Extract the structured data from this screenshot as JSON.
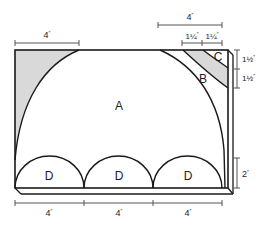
{
  "diagram": {
    "type": "geometry-area-figure",
    "colors": {
      "stroke": "#1a1a1a",
      "shaded": "#d9d9d9",
      "background": "#ffffff",
      "dimension_line": "#555555"
    },
    "regions": {
      "A": "A",
      "B": "B",
      "C": "C",
      "D1": "D",
      "D2": "D",
      "D3": "D"
    },
    "dimensions": {
      "top_left_width": "4",
      "top_right_width": "4",
      "top_right_segment_1": "1¼",
      "top_right_segment_2": "1¼",
      "right_upper_1": "1½",
      "right_upper_2": "1½",
      "right_lower": "2",
      "bottom_1": "4",
      "bottom_2": "4",
      "bottom_3": "4"
    },
    "units": {
      "inch_mark": "″"
    }
  }
}
